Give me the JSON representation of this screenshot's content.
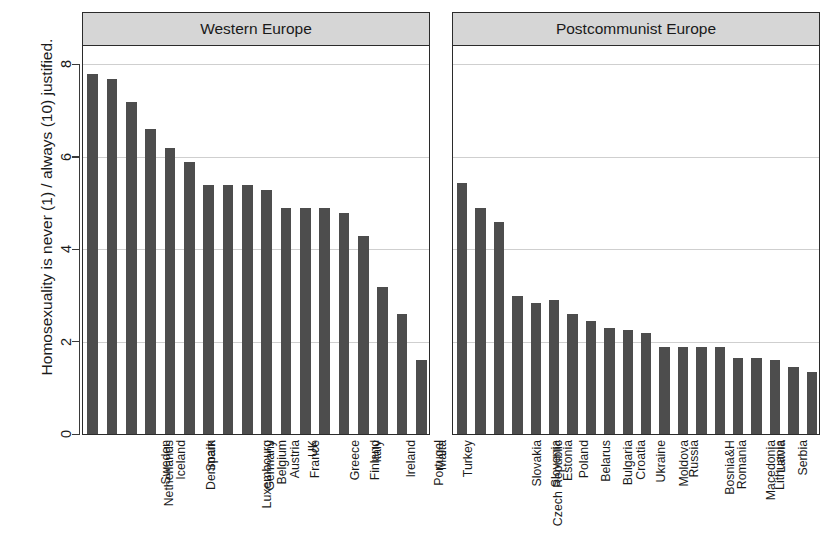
{
  "chart_data": {
    "type": "bar",
    "title": "",
    "xlabel": "",
    "ylabel": "Homosexuality is never (1) / always (10) justified.",
    "ylim": [
      0,
      8.6
    ],
    "yticks": [
      0,
      2,
      4,
      6,
      8
    ],
    "grid": true,
    "legend": "none",
    "orientation": "vertical",
    "bar_color": "#4d4d4d",
    "panel_header_color": "#d6d6d6",
    "panels": [
      {
        "label": "Western Europe",
        "categories": [
          "Netherlands",
          "Sweden",
          "Iceland",
          "Denmark",
          "Spain",
          "Luxembourg",
          "Germany",
          "Belgium",
          "Austria",
          "France",
          "UK",
          "Greece",
          "Finland",
          "Italy",
          "Ireland",
          "Portugal",
          "Malta",
          "Turkey"
        ],
        "values": [
          7.8,
          7.7,
          7.2,
          6.6,
          6.2,
          5.9,
          5.4,
          5.4,
          5.4,
          5.3,
          4.9,
          4.9,
          4.9,
          4.8,
          4.3,
          3.2,
          2.6,
          1.6
        ]
      },
      {
        "label": "Postcommunist Europe",
        "categories": [
          "Czech Republic",
          "Slovakia",
          "Slovenia",
          "Estonia",
          "Poland",
          "Belarus",
          "Bulgaria",
          "Croatia",
          "Ukraine",
          "Moldova",
          "Russia",
          "Bosnia&H",
          "Romania",
          "Macedonia",
          "Lithuania",
          "Latvia",
          "Serbia",
          "Montenegro",
          "Albania",
          "Hungary"
        ],
        "values": [
          5.45,
          4.9,
          4.6,
          3.0,
          2.85,
          2.9,
          2.6,
          2.45,
          2.3,
          2.25,
          2.2,
          1.9,
          1.9,
          1.9,
          1.9,
          1.65,
          1.65,
          1.6,
          1.45,
          1.35
        ]
      }
    ]
  }
}
